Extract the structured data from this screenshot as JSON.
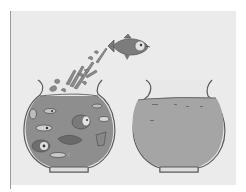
{
  "illustration": {
    "subject": "fish leaping from a crowded fishbowl into an empty fishbowl",
    "colors": {
      "background": "#ffffff",
      "panel": "#ebebeb",
      "water_crowded": "#8e8e8e",
      "water_empty": "#a5a5a5",
      "outline": "#5a5a5a",
      "fish": "#7a7a7a"
    },
    "left_bowl": {
      "label": "crowded-bowl",
      "fish_count": 10
    },
    "right_bowl": {
      "label": "empty-bowl",
      "fish_count": 0
    },
    "jumping_fish": {
      "label": "leaping-fish"
    }
  }
}
